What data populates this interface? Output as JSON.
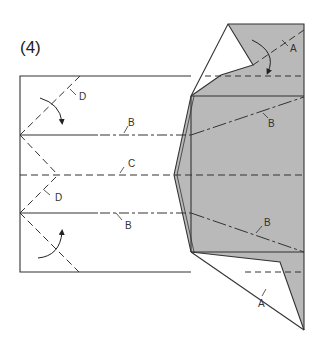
{
  "step_label": "(4)",
  "colors": {
    "paper_back": "#b9b9b9",
    "paper_front": "#ffffff",
    "line": "#333333"
  },
  "crease_labels": {
    "top_valley": "A",
    "bottom_valley": "A",
    "upper_left_B": "B",
    "upper_right_B": "B",
    "center": "C",
    "lower_left_B": "B",
    "lower_right_B": "B",
    "upper_D": "D",
    "lower_D": "D"
  },
  "arrows": [
    {
      "name": "fold-arrow-top-right",
      "direction": "down"
    },
    {
      "name": "fold-arrow-upper-left",
      "direction": "down"
    },
    {
      "name": "fold-arrow-lower-left",
      "direction": "up"
    }
  ]
}
